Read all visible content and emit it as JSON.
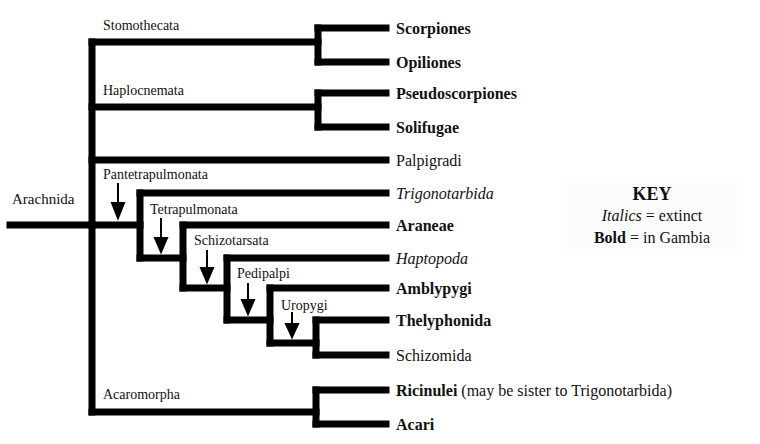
{
  "root": {
    "label": "Arachnida"
  },
  "clades": {
    "stomothecata": "Stomothecata",
    "haplocnemata": "Haplocnemata",
    "pantetrapulmonata": "Pantetrapulmonata",
    "tetrapulmonata": "Tetrapulmonata",
    "schizotarsata": "Schizotarsata",
    "pedipalpi": "Pedipalpi",
    "uropygi": "Uropygi",
    "acaromorpha": "Acaromorpha"
  },
  "leaves": [
    {
      "label": "Scorpiones",
      "style": "bold"
    },
    {
      "label": "Opiliones",
      "style": "bold"
    },
    {
      "label": "Pseudoscorpiones",
      "style": "bold"
    },
    {
      "label": "Solifugae",
      "style": "bold"
    },
    {
      "label": "Palpigradi",
      "style": "normal"
    },
    {
      "label": "Trigonotarbida",
      "style": "italic"
    },
    {
      "label": "Araneae",
      "style": "bold"
    },
    {
      "label": "Haptopoda",
      "style": "italic"
    },
    {
      "label": "Amblypygi",
      "style": "bold"
    },
    {
      "label": "Thelyphonida",
      "style": "bold"
    },
    {
      "label": "Schizomida",
      "style": "normal"
    },
    {
      "label": "Ricinulei",
      "style": "bold",
      "note": "(may be sister to Trigonotarbida)"
    },
    {
      "label": "Acari",
      "style": "bold"
    }
  ],
  "key": {
    "title": "KEY",
    "italics_word": "Italics",
    "italics_meaning": "= extinct",
    "bold_word": "Bold",
    "bold_meaning": "= in Gambia"
  },
  "colors": {
    "line": "#000000",
    "background": "#ffffff"
  }
}
